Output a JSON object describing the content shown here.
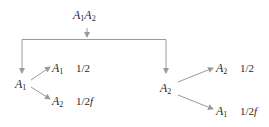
{
  "diagram": {
    "type": "tree",
    "line_color": "#9a9a9a",
    "root": {
      "label": "A1A2",
      "parts": [
        {
          "sym": "A",
          "sub": "1"
        },
        {
          "sym": "A",
          "sub": "2"
        }
      ]
    },
    "branches": [
      {
        "node": {
          "sym": "A",
          "sub": "1"
        },
        "children": [
          {
            "sym": "A",
            "sub": "1",
            "prob_num": "1/2",
            "prob_suffix": ""
          },
          {
            "sym": "A",
            "sub": "2",
            "prob_num": "1/2",
            "prob_suffix": "f"
          }
        ]
      },
      {
        "node": {
          "sym": "A",
          "sub": "2"
        },
        "children": [
          {
            "sym": "A",
            "sub": "2",
            "prob_num": "1/2",
            "prob_suffix": ""
          },
          {
            "sym": "A",
            "sub": "1",
            "prob_num": "1/2",
            "prob_suffix": "f"
          }
        ]
      }
    ]
  }
}
